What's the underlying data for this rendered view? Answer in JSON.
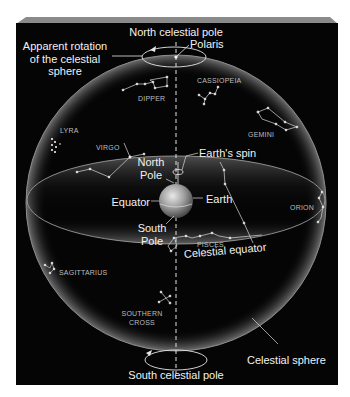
{
  "diagram": {
    "title": "Celestial sphere",
    "colors": {
      "background": "#ffffff",
      "panel": "#050505",
      "panel_top_bevel": "#8a8a8a",
      "sphere_rim": "#9a9a9a",
      "label": "#f2f2f2",
      "constellation_label": "#bdbdbd",
      "lines": "#e6e6e6"
    },
    "labels": {
      "north_celestial_pole": "North celestial pole",
      "polaris": "Polaris",
      "apparent_rotation": [
        "Apparent rotation",
        "of the celestial",
        "sphere"
      ],
      "north_pole": [
        "North",
        "Pole"
      ],
      "earths_spin": "Earth's spin",
      "earth": "Earth",
      "equator": "Equator",
      "south_pole": [
        "South",
        "Pole"
      ],
      "celestial_equator": "Celestial equator",
      "celestial_sphere": "Celestial sphere",
      "south_celestial_pole": "South celestial pole"
    },
    "constellations": {
      "cassiopeia": "CASSIOPEIA",
      "dipper": "DIPPER",
      "lyra": "LYRA",
      "virgo": "VIRGO",
      "gemini": "GEMINI",
      "orion": "ORION",
      "pisces": "PISCES",
      "sagittarius": "SAGITTARIUS",
      "southern_cross": [
        "SOUTHERN",
        "CROSS"
      ]
    }
  }
}
